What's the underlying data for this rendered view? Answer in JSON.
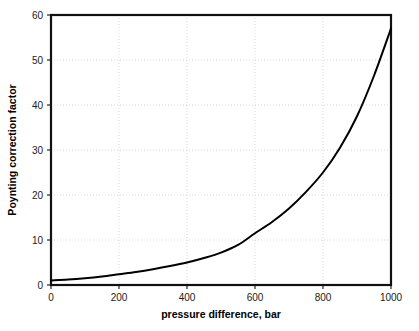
{
  "chart_data": {
    "type": "line",
    "title": "",
    "xlabel": "pressure difference, bar",
    "ylabel": "Poynting correction factor",
    "xlim": [
      0,
      1000
    ],
    "ylim": [
      0,
      60
    ],
    "grid": true,
    "legend": false,
    "xticks": [
      0,
      200,
      400,
      600,
      800,
      1000
    ],
    "xtick_labels": [
      "0",
      "200",
      "400",
      "600",
      "800",
      "1000"
    ],
    "yticks": [
      0,
      10,
      20,
      30,
      40,
      50,
      60
    ],
    "ytick_labels": [
      "0",
      "10",
      "20",
      "30",
      "40",
      "50",
      "60"
    ],
    "series": [
      {
        "name": "Poynting correction factor",
        "color": "#000000",
        "x": [
          0,
          50,
          100,
          150,
          200,
          250,
          300,
          350,
          400,
          450,
          500,
          550,
          600,
          650,
          700,
          750,
          800,
          850,
          900,
          950,
          1000
        ],
        "values": [
          1.0,
          1.2,
          1.5,
          1.9,
          2.4,
          2.9,
          3.5,
          4.2,
          5.0,
          6.0,
          7.2,
          8.9,
          11.5,
          14.0,
          17.0,
          20.7,
          25.0,
          30.5,
          37.5,
          46.5,
          57.0
        ]
      }
    ]
  },
  "axes": {
    "x_title": "pressure difference, bar",
    "y_title": "Poynting correction factor"
  }
}
